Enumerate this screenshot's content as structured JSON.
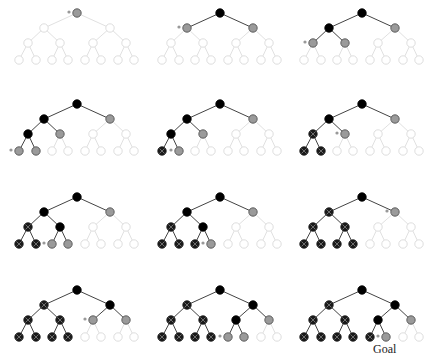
{
  "colors": {
    "unexplored_stroke": "#d9d9d9",
    "unexplored_fill": "#ffffff",
    "frontier_fill": "#9a9a9a",
    "frontier_stroke": "#555555",
    "expanded_fill": "#000000",
    "dead_fill": "#1a1a1a",
    "dead_cross": "#777777",
    "edge_active": "#444444",
    "edge_inactive": "#dddddd",
    "marker": "#999999"
  },
  "tree": {
    "nodes": [
      {
        "id": 0,
        "x": 77,
        "y": 13
      },
      {
        "id": 1,
        "x": 44,
        "y": 28
      },
      {
        "id": 2,
        "x": 110,
        "y": 28
      },
      {
        "id": 3,
        "x": 28,
        "y": 43
      },
      {
        "id": 4,
        "x": 60,
        "y": 43
      },
      {
        "id": 5,
        "x": 93,
        "y": 43
      },
      {
        "id": 6,
        "x": 126,
        "y": 43
      },
      {
        "id": 7,
        "x": 19,
        "y": 60
      },
      {
        "id": 8,
        "x": 36,
        "y": 60
      },
      {
        "id": 9,
        "x": 52,
        "y": 60
      },
      {
        "id": 10,
        "x": 68,
        "y": 60
      },
      {
        "id": 11,
        "x": 85,
        "y": 60
      },
      {
        "id": 12,
        "x": 101,
        "y": 60
      },
      {
        "id": 13,
        "x": 118,
        "y": 60
      },
      {
        "id": 14,
        "x": 134,
        "y": 60
      }
    ],
    "edges": [
      [
        0,
        1
      ],
      [
        0,
        2
      ],
      [
        1,
        3
      ],
      [
        1,
        4
      ],
      [
        2,
        5
      ],
      [
        2,
        6
      ],
      [
        3,
        7
      ],
      [
        3,
        8
      ],
      [
        4,
        9
      ],
      [
        4,
        10
      ],
      [
        5,
        11
      ],
      [
        5,
        12
      ],
      [
        6,
        13
      ],
      [
        6,
        14
      ]
    ]
  },
  "legend_states": [
    "unexplored",
    "frontier",
    "expanded",
    "dead"
  ],
  "panels": [
    {
      "col": 0,
      "row": 0,
      "marker": 0,
      "states": {
        "0": "frontier"
      }
    },
    {
      "col": 1,
      "row": 0,
      "marker": 1,
      "states": {
        "0": "expanded",
        "1": "frontier",
        "2": "frontier"
      }
    },
    {
      "col": 2,
      "row": 0,
      "marker": 3,
      "states": {
        "0": "expanded",
        "1": "expanded",
        "2": "frontier",
        "3": "frontier",
        "4": "frontier"
      }
    },
    {
      "col": 0,
      "row": 1,
      "marker": 7,
      "states": {
        "0": "expanded",
        "1": "expanded",
        "2": "frontier",
        "3": "expanded",
        "4": "frontier",
        "7": "frontier",
        "8": "frontier"
      }
    },
    {
      "col": 1,
      "row": 1,
      "marker": 8,
      "states": {
        "0": "expanded",
        "1": "expanded",
        "2": "frontier",
        "3": "expanded",
        "4": "frontier",
        "7": "dead",
        "8": "frontier"
      }
    },
    {
      "col": 2,
      "row": 1,
      "marker": 4,
      "states": {
        "0": "expanded",
        "1": "expanded",
        "2": "frontier",
        "3": "dead",
        "4": "frontier",
        "7": "dead",
        "8": "dead"
      }
    },
    {
      "col": 0,
      "row": 2,
      "marker": 9,
      "states": {
        "0": "expanded",
        "1": "expanded",
        "2": "frontier",
        "3": "dead",
        "4": "expanded",
        "7": "dead",
        "8": "dead",
        "9": "frontier",
        "10": "frontier"
      }
    },
    {
      "col": 1,
      "row": 2,
      "marker": 10,
      "states": {
        "0": "expanded",
        "1": "expanded",
        "2": "frontier",
        "3": "dead",
        "4": "expanded",
        "7": "dead",
        "8": "dead",
        "9": "dead",
        "10": "frontier"
      }
    },
    {
      "col": 2,
      "row": 2,
      "marker": 2,
      "states": {
        "0": "expanded",
        "1": "dead",
        "2": "frontier",
        "3": "dead",
        "4": "dead",
        "7": "dead",
        "8": "dead",
        "9": "dead",
        "10": "dead"
      }
    },
    {
      "col": 0,
      "row": 3,
      "marker": 5,
      "states": {
        "0": "expanded",
        "1": "dead",
        "2": "expanded",
        "3": "dead",
        "4": "dead",
        "5": "frontier",
        "6": "frontier",
        "7": "dead",
        "8": "dead",
        "9": "dead",
        "10": "dead"
      }
    },
    {
      "col": 1,
      "row": 3,
      "marker": 11,
      "states": {
        "0": "expanded",
        "1": "dead",
        "2": "expanded",
        "3": "dead",
        "4": "dead",
        "5": "expanded",
        "6": "frontier",
        "7": "dead",
        "8": "dead",
        "9": "dead",
        "10": "dead",
        "11": "frontier",
        "12": "frontier"
      }
    },
    {
      "col": 2,
      "row": 3,
      "marker": 12,
      "states": {
        "0": "expanded",
        "1": "dead",
        "2": "expanded",
        "3": "dead",
        "4": "dead",
        "5": "expanded",
        "6": "frontier",
        "7": "dead",
        "8": "dead",
        "9": "dead",
        "10": "dead",
        "11": "dead",
        "12": "frontier"
      },
      "goal_node": 12
    }
  ],
  "layout": {
    "col_offsets": [
      0,
      143,
      285
    ],
    "row_offsets": [
      0,
      91,
      184,
      277
    ],
    "node_radius": 4.2
  },
  "goal": {
    "label": "Goal"
  }
}
